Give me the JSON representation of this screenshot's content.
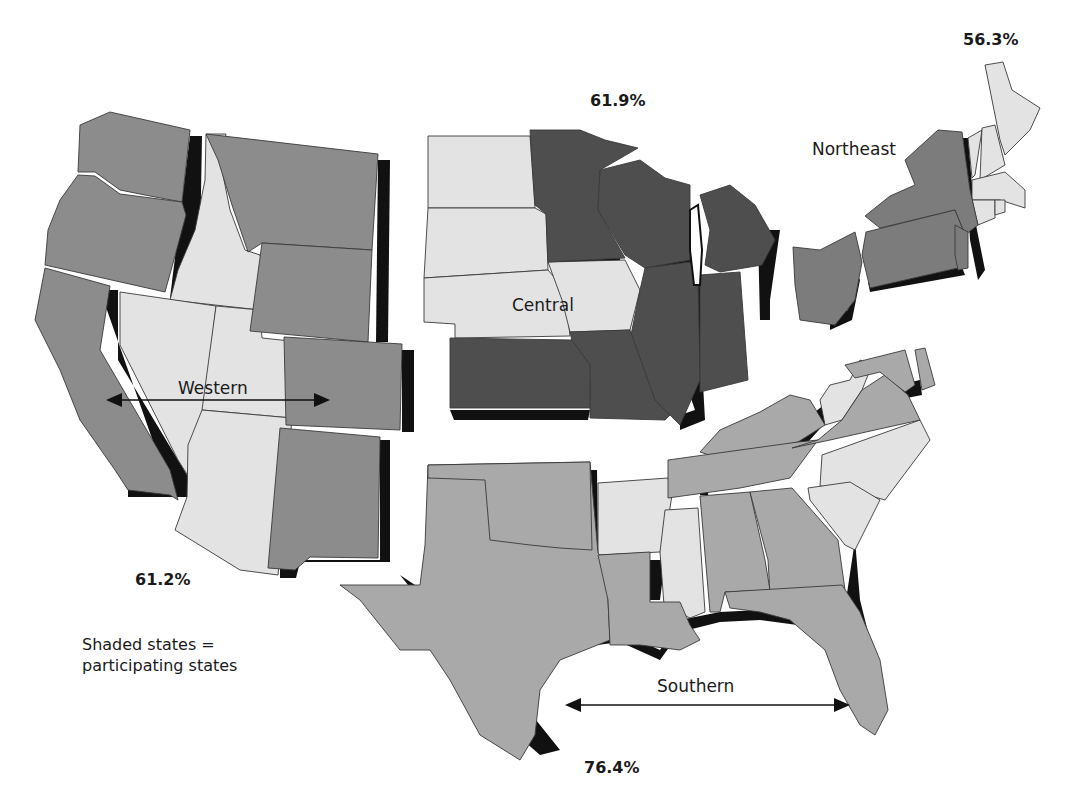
{
  "map": {
    "title": "",
    "legend": {
      "line1": "Shaded states =",
      "line2": "participating states"
    },
    "colors": {
      "western": "#8c8c8c",
      "central": "#4e4e4e",
      "northeast": "#7c7c7c",
      "southern": "#a9a9a9",
      "non_participating": "#e3e3e3",
      "shadow": "#111111"
    },
    "regions": [
      {
        "name": "Western",
        "percent": "61.2%",
        "participating": [
          "Washington",
          "Oregon",
          "California",
          "Montana",
          "Wyoming",
          "Colorado",
          "New Mexico"
        ],
        "non_participating": [
          "Idaho",
          "Nevada",
          "Utah",
          "Arizona"
        ]
      },
      {
        "name": "Central",
        "percent": "61.9%",
        "participating": [
          "Minnesota",
          "Wisconsin",
          "Michigan",
          "Illinois",
          "Indiana",
          "Missouri",
          "Kansas"
        ],
        "non_participating": [
          "North Dakota",
          "South Dakota",
          "Nebraska",
          "Iowa"
        ]
      },
      {
        "name": "Northeast",
        "percent": "56.3%",
        "participating": [
          "New York",
          "Pennsylvania",
          "New Jersey",
          "Ohio"
        ],
        "non_participating": [
          "Maine",
          "New Hampshire",
          "Vermont",
          "Massachusetts",
          "Connecticut",
          "Rhode Island"
        ]
      },
      {
        "name": "Southern",
        "percent": "76.4%",
        "participating": [
          "Texas",
          "Oklahoma",
          "Louisiana",
          "Tennessee",
          "Kentucky",
          "Alabama",
          "Georgia",
          "Florida",
          "Virginia",
          "Maryland",
          "Delaware"
        ],
        "non_participating": [
          "Arkansas",
          "Mississippi",
          "North Carolina",
          "South Carolina",
          "West Virginia"
        ]
      }
    ]
  },
  "labels": {
    "western": "Western",
    "central": "Central",
    "northeast": "Northeast",
    "southern": "Southern",
    "western_pct": "61.2%",
    "central_pct": "61.9%",
    "northeast_pct": "56.3%",
    "southern_pct": "76.4%"
  }
}
